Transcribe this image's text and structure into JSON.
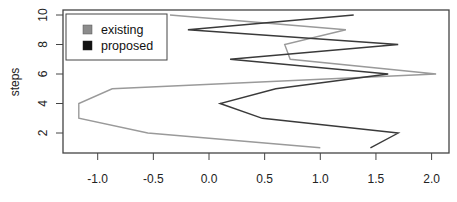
{
  "chart_data": {
    "type": "line",
    "title": "",
    "xlabel": "",
    "ylabel": "steps",
    "xlim": [
      -1.3,
      2.15
    ],
    "ylim": [
      0.6,
      10.3
    ],
    "xticks": [
      -1.0,
      -0.5,
      0.0,
      0.5,
      1.0,
      1.5,
      2.0
    ],
    "xtick_labels": [
      "-1.0",
      "-0.5",
      "0.0",
      "0.5",
      "1.0",
      "1.5",
      "2.0"
    ],
    "yticks": [
      2,
      4,
      6,
      8,
      10
    ],
    "ytick_labels": [
      "2",
      "4",
      "6",
      "8",
      "10"
    ],
    "grid": false,
    "legend_position": "top-left",
    "series": [
      {
        "name": "existing",
        "color": "#9a9a9a",
        "points": [
          {
            "x": 1.0,
            "y": 1
          },
          {
            "x": -0.55,
            "y": 2
          },
          {
            "x": -1.17,
            "y": 3
          },
          {
            "x": -1.17,
            "y": 4
          },
          {
            "x": -0.87,
            "y": 5
          },
          {
            "x": 2.04,
            "y": 6
          },
          {
            "x": 0.73,
            "y": 7
          },
          {
            "x": 0.68,
            "y": 8
          },
          {
            "x": 1.23,
            "y": 9
          },
          {
            "x": -0.35,
            "y": 10
          }
        ]
      },
      {
        "name": "proposed",
        "color": "#3a3a3a",
        "points": [
          {
            "x": 1.45,
            "y": 1
          },
          {
            "x": 1.7,
            "y": 2
          },
          {
            "x": 0.48,
            "y": 3
          },
          {
            "x": 0.1,
            "y": 4
          },
          {
            "x": 0.6,
            "y": 5
          },
          {
            "x": 1.61,
            "y": 6
          },
          {
            "x": 0.19,
            "y": 7
          },
          {
            "x": 1.7,
            "y": 8
          },
          {
            "x": -0.19,
            "y": 9
          },
          {
            "x": 1.3,
            "y": 10
          }
        ]
      }
    ]
  },
  "legend": {
    "items": [
      {
        "label": "existing",
        "color": "#8c8c8c"
      },
      {
        "label": "proposed",
        "color": "#111111"
      }
    ]
  },
  "axes": {
    "ylabel": "steps"
  }
}
